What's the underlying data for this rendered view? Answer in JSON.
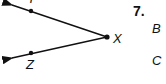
{
  "diagram": {
    "problem_number": "7.",
    "vertex_label": "X",
    "point_labels": [
      "Y",
      "Z"
    ],
    "answer_choice_labels": [
      "B",
      "C"
    ],
    "rays": [
      {
        "name": "ray XY",
        "from": "X",
        "through": "Y"
      },
      {
        "name": "ray XZ",
        "from": "X",
        "through": "Z"
      }
    ],
    "angle": "angle YXZ",
    "color": "#111111"
  }
}
